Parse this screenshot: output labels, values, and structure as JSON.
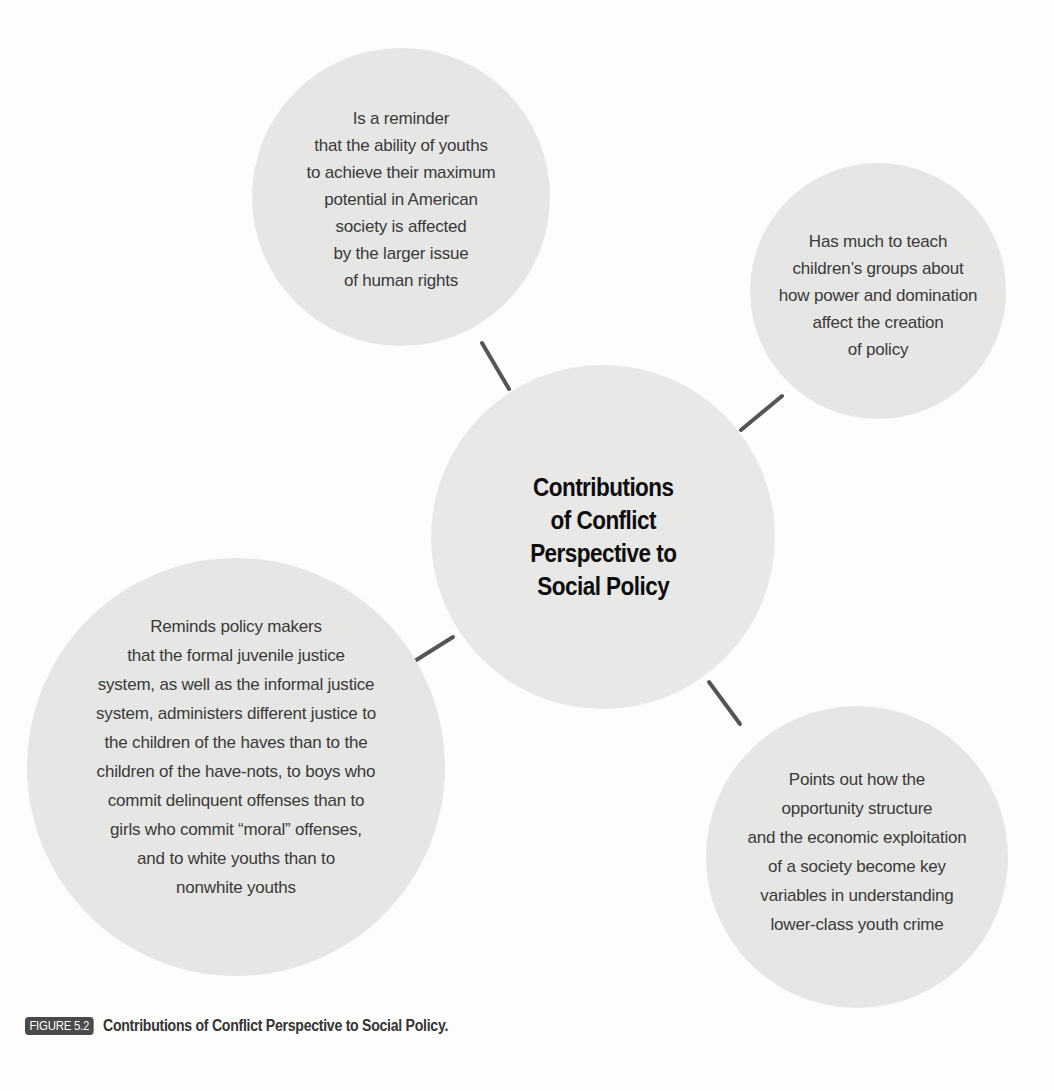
{
  "diagram": {
    "center": {
      "title_lines": [
        "Contributions",
        "of Conflict",
        "Perspective to",
        "Social Policy"
      ]
    },
    "nodes": [
      {
        "id": "top-left",
        "lines": [
          "Is a reminder",
          "that the ability of youths",
          "to achieve their maximum",
          "potential in American",
          "society is affected",
          "by the larger issue",
          "of human rights"
        ]
      },
      {
        "id": "top-right",
        "lines": [
          "Has much to teach",
          "children’s groups about",
          "how power and domination",
          "affect the creation",
          "of policy"
        ]
      },
      {
        "id": "bottom-left",
        "lines": [
          "Reminds policy makers",
          "that the formal juvenile justice",
          "system, as well as the informal justice",
          "system, administers different justice to",
          "the children of the haves than to the",
          "children of the have-nots, to boys who",
          "commit delinquent offenses than to",
          "girls who commit “moral” offenses,",
          "and to white youths than to",
          "nonwhite youths"
        ]
      },
      {
        "id": "bottom-right",
        "lines": [
          "Points out how the",
          "opportunity structure",
          "and the economic exploitation",
          "of a society become key",
          "variables in understanding",
          "lower-class youth crime"
        ]
      }
    ],
    "colors": {
      "bubble_fill": "#e6e6e5",
      "connector": "#555555",
      "body_text": "#3a3a3a",
      "title_text": "#0d0d0d",
      "figure_label_bg": "#4a4a4a"
    }
  },
  "caption": {
    "figure_label": "FIGURE 5.2",
    "text": "Contributions of Conflict Perspective to Social Policy."
  }
}
